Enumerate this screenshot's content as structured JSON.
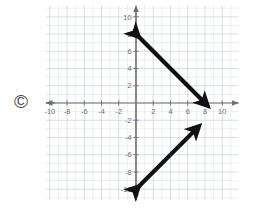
{
  "figure": {
    "title": "",
    "watermark": "©",
    "watermark_name": "copyright-symbol"
  },
  "chart_data": {
    "type": "line",
    "title": "",
    "xlabel": "",
    "ylabel": "",
    "xlim": [
      -11,
      11
    ],
    "ylim": [
      -11,
      11
    ],
    "grid": true,
    "minor_grid_step": 1,
    "major_grid_step": 2,
    "legend": "none",
    "axis_arrows": true,
    "x_ticks": [
      -10,
      -8,
      -6,
      -4,
      -2,
      2,
      4,
      6,
      8,
      10
    ],
    "y_ticks": [
      10,
      8,
      6,
      4,
      2,
      -2,
      -4,
      -6,
      -8,
      -10
    ],
    "x_tick_labels": [
      "-10",
      "-8",
      "-6",
      "-4",
      "-2",
      "2",
      "4",
      "6",
      "8",
      "10"
    ],
    "y_tick_labels": [
      "10",
      "8",
      "6",
      "4",
      "2",
      "-2",
      "-4",
      "-6",
      "-8",
      "-10"
    ],
    "origin_label": "",
    "series": [
      {
        "name": "line-1",
        "style": "double-arrow-segment",
        "color": "#111111",
        "slope": -1,
        "intercept": 8,
        "x": [
          0,
          8
        ],
        "y": [
          8,
          0
        ],
        "start_point": [
          0,
          8
        ],
        "end_point": [
          8,
          0
        ],
        "arrow_start": true,
        "arrow_end": true
      },
      {
        "name": "line-2",
        "style": "double-arrow-segment",
        "color": "#111111",
        "slope": 1,
        "intercept": -10,
        "x": [
          0,
          7
        ],
        "y": [
          -10,
          -3
        ],
        "start_point": [
          0,
          -10
        ],
        "end_point": [
          7,
          -3
        ],
        "arrow_start": true,
        "arrow_end": true
      }
    ]
  }
}
